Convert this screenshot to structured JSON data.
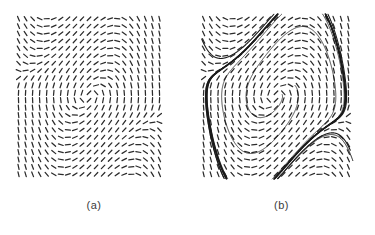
{
  "figure": {
    "kind": "phase-portrait",
    "panel_count": 2,
    "background_color": "#ffffff",
    "ink_color": "#2b2b2b"
  },
  "panels": [
    {
      "id": "a",
      "caption": "(a)",
      "content": "direction field only"
    },
    {
      "id": "b",
      "caption": "(b)",
      "content": "direction field with trajectories approaching limit cycle"
    }
  ],
  "chart_data": {
    "type": "scatter",
    "title": "",
    "subtitle": "",
    "xlabel": "",
    "ylabel": "",
    "grid": false,
    "legend": null,
    "panels": [
      {
        "label": "(a)",
        "plot_type": "direction-field",
        "xlim": [
          -2.2,
          2.2
        ],
        "ylim": [
          -2.2,
          2.2
        ],
        "grid_cols": 21,
        "grid_rows": 22,
        "glyph": "dash",
        "glyph_length_px": 5.0,
        "system": {
          "name": "van der Pol-like oscillator",
          "dx": "y",
          "dy": "mu*(1 - x*x)*y - x",
          "mu": 1.0
        },
        "fixed_points": [
          {
            "x": 0.0,
            "y": 0.0,
            "type": "unstable spiral"
          }
        ],
        "trajectories": []
      },
      {
        "label": "(b)",
        "plot_type": "direction-field-with-trajectories",
        "xlim": [
          -2.2,
          2.2
        ],
        "ylim": [
          -2.2,
          2.2
        ],
        "grid_cols": 21,
        "grid_rows": 22,
        "glyph": "dash",
        "glyph_length_px": 5.0,
        "system": {
          "name": "van der Pol-like oscillator",
          "dx": "y",
          "dy": "mu*(1 - x*x)*y - x",
          "mu": 1.0
        },
        "fixed_points": [
          {
            "x": 0.0,
            "y": 0.0,
            "type": "unstable spiral"
          }
        ],
        "limit_cycle": {
          "stable": true,
          "x_extent": [
            -2.02,
            2.02
          ],
          "y_extent": [
            -2.68,
            2.68
          ],
          "stroke_width_px": 1.8
        },
        "trajectories": [
          {
            "name": "inner-outward-1",
            "start": [
              0.18,
              0.05
            ],
            "direction": "outward",
            "turns": 3.4,
            "stroke_width_px": 0.8
          },
          {
            "name": "inner-outward-2",
            "start": [
              0.55,
              0.3
            ],
            "direction": "outward",
            "turns": 2.6,
            "stroke_width_px": 0.8
          },
          {
            "name": "outer-inward-1",
            "start": [
              -2.15,
              1.55
            ],
            "direction": "inward",
            "turns": 1.6,
            "stroke_width_px": 1.1
          },
          {
            "name": "outer-inward-2",
            "start": [
              2.15,
              -1.45
            ],
            "direction": "inward",
            "turns": 1.6,
            "stroke_width_px": 1.1
          },
          {
            "name": "outer-inward-3",
            "start": [
              2.3,
              -1.95
            ],
            "direction": "inward",
            "turns": 1.4,
            "stroke_width_px": 1.0
          }
        ]
      }
    ]
  }
}
